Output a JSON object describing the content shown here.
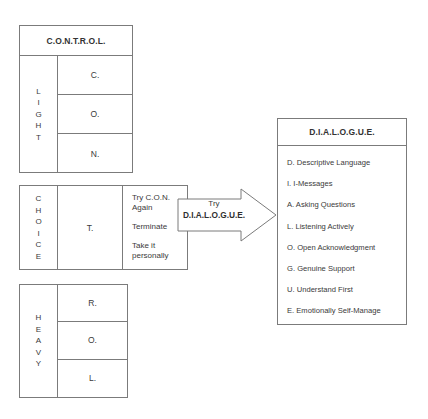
{
  "diagram": {
    "control": {
      "title": "C.O.N.T.R.O.L.",
      "side_label": "LIGHT",
      "steps": [
        "C.",
        "O.",
        "N."
      ]
    },
    "choice": {
      "side_label": "CHOICE",
      "step": "T.",
      "options": [
        "Try C.O.N. Again",
        "Terminate",
        "Take it personally"
      ]
    },
    "heavy": {
      "side_label": "HEAVY",
      "steps": [
        "R.",
        "O.",
        "L."
      ]
    },
    "arrow": {
      "line1": "Try",
      "line2": "D.I.A.L.O.G.U.E."
    },
    "dialogue": {
      "title": "D.I.A.L.O.G.U.E.",
      "items": [
        "D. Descriptive Language",
        "I.  I-Messages",
        "A. Asking Questions",
        "L. Listening Actively",
        "O. Open Acknowledgment",
        "G. Genuine Support",
        "U. Understand First",
        "E. Emotionally Self-Manage"
      ]
    }
  }
}
